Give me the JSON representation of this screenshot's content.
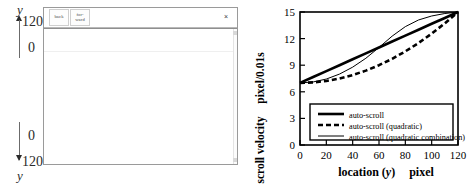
{
  "left_panel": {
    "axis_top": {
      "symbol": "y",
      "upper_value": "120",
      "lower_value": "0"
    },
    "axis_bottom": {
      "upper_value": "0",
      "lower_value": "120",
      "symbol": "y"
    },
    "window": {
      "toolbar": {
        "back_label": "back",
        "forward_label_line1": "for-",
        "forward_label_line2": "ward",
        "close_label": "×"
      }
    }
  },
  "chart_data": {
    "type": "line",
    "title": "",
    "xlabel": "location (y)      pixel",
    "xlabel_parts": {
      "main": "location (",
      "italic": "y",
      "close": ")",
      "unit": "pixel"
    },
    "ylabel": "scroll velocity",
    "ylabel_unit": "pixel/0.01s",
    "xlim": [
      0,
      120
    ],
    "ylim": [
      0,
      15
    ],
    "xticks": [
      "0",
      "20",
      "40",
      "60",
      "80",
      "100",
      "120"
    ],
    "xtick_values": [
      0,
      20,
      40,
      60,
      80,
      100,
      120
    ],
    "yticks": [
      "0",
      "3",
      "6",
      "9",
      "12",
      "15"
    ],
    "ytick_values": [
      0,
      3,
      6,
      9,
      12,
      15
    ],
    "grid": false,
    "legend_position": "lower-center",
    "x": [
      0,
      10,
      20,
      30,
      40,
      50,
      60,
      70,
      80,
      90,
      100,
      110,
      120
    ],
    "series": [
      {
        "name": "auto-scroll",
        "style": "solid-thick",
        "values": [
          7.0,
          7.67,
          8.33,
          9.0,
          9.67,
          10.33,
          11.0,
          11.67,
          12.33,
          13.0,
          13.67,
          14.33,
          15.0
        ]
      },
      {
        "name": "auto-scroll (quadratic)",
        "style": "dashed-thick",
        "values": [
          7.0,
          7.06,
          7.22,
          7.5,
          7.89,
          8.39,
          9.0,
          9.72,
          10.56,
          11.5,
          12.56,
          13.72,
          15.0
        ]
      },
      {
        "name": "auto-scroll (quadratic combination)",
        "style": "solid-thin",
        "values": [
          7.0,
          7.11,
          7.44,
          8.0,
          8.78,
          9.78,
          11.0,
          12.28,
          13.35,
          14.1,
          14.55,
          14.83,
          15.0
        ]
      }
    ]
  }
}
